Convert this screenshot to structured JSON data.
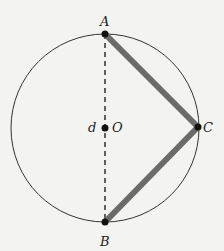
{
  "diagram": {
    "labels": {
      "A": "A",
      "B": "B",
      "C": "C",
      "O": "O",
      "d": "d"
    },
    "colors": {
      "background": "#f3f3f1",
      "circle": "#333333",
      "chord": "#6b6b6b",
      "point": "#111111"
    }
  }
}
